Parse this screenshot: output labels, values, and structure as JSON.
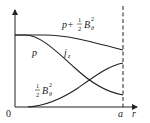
{
  "diagram": {
    "type": "radial-profile-sketch",
    "axes": {
      "origin_label": "0",
      "x_label": "r",
      "boundary_label": "a"
    },
    "curves": [
      {
        "id": "total-pressure",
        "label_main": "p+",
        "label_frac_num": "1",
        "label_frac_den": "2",
        "label_var": "B",
        "label_sub": "θ",
        "label_sup": "2"
      },
      {
        "id": "pressure",
        "label": "p"
      },
      {
        "id": "current-density",
        "label_var": "j",
        "label_sub": "z"
      },
      {
        "id": "magnetic-pressure",
        "label_frac_num": "1",
        "label_frac_den": "2",
        "label_var": "B",
        "label_sub": "θ",
        "label_sup": "2"
      }
    ],
    "colors": {
      "line": "#222222",
      "background": "#ffffff"
    }
  }
}
